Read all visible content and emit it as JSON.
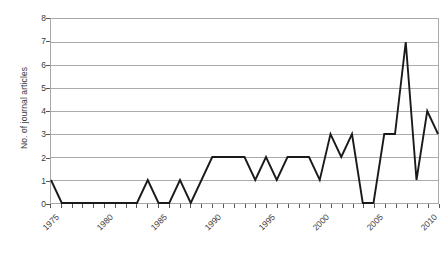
{
  "chart_data": {
    "type": "line",
    "title": "",
    "xlabel": "",
    "ylabel": "No. of journal articles",
    "ylim": [
      0,
      8
    ],
    "xlim": [
      1975,
      2011
    ],
    "y_ticks": [
      0,
      1,
      2,
      3,
      4,
      5,
      6,
      7,
      8
    ],
    "x_ticks": [
      1975,
      1976,
      1977,
      1978,
      1979,
      1980,
      1981,
      1982,
      1983,
      1984,
      1985,
      1986,
      1987,
      1988,
      1989,
      1990,
      1991,
      1992,
      1993,
      1994,
      1995,
      1996,
      1997,
      1998,
      1999,
      2000,
      2001,
      2002,
      2003,
      2004,
      2005,
      2006,
      2007,
      2008,
      2009,
      2010,
      2011
    ],
    "x_tick_labels": [
      1975,
      1980,
      1985,
      1990,
      1995,
      2000,
      2005,
      2010
    ],
    "grid": true,
    "grid_axis": "y",
    "legend": false,
    "line_color": "#1a1a1a",
    "grid_color": "#aaaaaa",
    "axis_color": "#555555",
    "x": [
      1975,
      1976,
      1977,
      1978,
      1979,
      1980,
      1981,
      1982,
      1983,
      1984,
      1985,
      1986,
      1987,
      1988,
      1989,
      1990,
      1991,
      1992,
      1993,
      1994,
      1995,
      1996,
      1997,
      1998,
      1999,
      2000,
      2001,
      2002,
      2003,
      2004,
      2005,
      2006,
      2007,
      2008,
      2009,
      2010,
      2011
    ],
    "values": [
      1,
      0,
      0,
      0,
      0,
      0,
      0,
      0,
      0,
      1,
      0,
      0,
      1,
      0,
      1,
      2,
      2,
      2,
      2,
      1,
      2,
      1,
      2,
      2,
      2,
      1,
      3,
      2,
      3,
      0,
      0,
      3,
      3,
      7,
      1,
      4,
      3
    ],
    "series": [
      {
        "name": "No. of journal articles",
        "values": [
          1,
          0,
          0,
          0,
          0,
          0,
          0,
          0,
          0,
          1,
          0,
          0,
          1,
          0,
          1,
          2,
          2,
          2,
          2,
          1,
          2,
          1,
          2,
          2,
          2,
          1,
          3,
          2,
          3,
          0,
          0,
          3,
          3,
          7,
          1,
          4,
          3
        ]
      }
    ]
  }
}
